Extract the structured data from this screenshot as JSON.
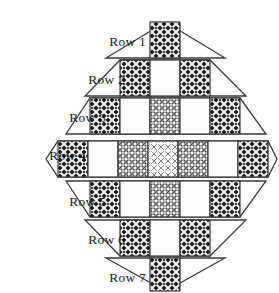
{
  "figure": {
    "background_color": "#ffffff",
    "outline_color": "#3a3a3a"
  },
  "patterns": {
    "dark": {
      "name": "dark-crosshatch",
      "fill": "#303030"
    },
    "medium": {
      "name": "medium-speckle",
      "fill": "#8a8a8a"
    },
    "light": {
      "name": "light-speckle",
      "fill": "#d0d0d0"
    },
    "white": {
      "name": "plain-white",
      "fill": "#ffffff"
    }
  },
  "rows": [
    {
      "label": "Row 1",
      "label_x": 146,
      "label_y": 46,
      "band_top": 22,
      "band_bottom": 58,
      "apex": "top",
      "left_x": 106,
      "right_x": 225,
      "cells": [
        {
          "pattern": "dark",
          "x": 150,
          "w": 30
        }
      ]
    },
    {
      "label": "Row 2",
      "label_x": 125,
      "label_y": 84,
      "band_top": 60,
      "band_bottom": 96,
      "apex": "none",
      "left_x": 85,
      "right_x": 246,
      "cells": [
        {
          "pattern": "dark",
          "x": 120,
          "w": 30
        },
        {
          "pattern": "white",
          "x": 150,
          "w": 30
        },
        {
          "pattern": "dark",
          "x": 180,
          "w": 30
        }
      ]
    },
    {
      "label": "Row 3",
      "label_x": 106,
      "label_y": 122,
      "band_top": 98,
      "band_bottom": 134,
      "apex": "none",
      "left_x": 66,
      "right_x": 266,
      "cells": [
        {
          "pattern": "dark",
          "x": 90,
          "w": 30
        },
        {
          "pattern": "white",
          "x": 120,
          "w": 30
        },
        {
          "pattern": "medium",
          "x": 150,
          "w": 30
        },
        {
          "pattern": "white",
          "x": 180,
          "w": 30
        },
        {
          "pattern": "dark",
          "x": 210,
          "w": 30
        }
      ]
    },
    {
      "label": "Row 4",
      "label_x": 86,
      "label_y": 160,
      "band_top": 141,
      "band_bottom": 177,
      "apex": "both",
      "left_x": 46,
      "right_x": 277,
      "cells": [
        {
          "pattern": "dark",
          "x": 58,
          "w": 30
        },
        {
          "pattern": "white",
          "x": 88,
          "w": 30
        },
        {
          "pattern": "medium",
          "x": 118,
          "w": 30
        },
        {
          "pattern": "light",
          "x": 148,
          "w": 30
        },
        {
          "pattern": "medium",
          "x": 178,
          "w": 30
        },
        {
          "pattern": "white",
          "x": 208,
          "w": 30
        },
        {
          "pattern": "dark",
          "x": 238,
          "w": 30
        }
      ]
    },
    {
      "label": "Row 5",
      "label_x": 106,
      "label_y": 206,
      "band_top": 181,
      "band_bottom": 217,
      "apex": "none",
      "left_x": 66,
      "right_x": 266,
      "cells": [
        {
          "pattern": "dark",
          "x": 90,
          "w": 30
        },
        {
          "pattern": "white",
          "x": 120,
          "w": 30
        },
        {
          "pattern": "medium",
          "x": 150,
          "w": 30
        },
        {
          "pattern": "white",
          "x": 180,
          "w": 30
        },
        {
          "pattern": "dark",
          "x": 210,
          "w": 30
        }
      ]
    },
    {
      "label": "Row 6",
      "label_x": 125,
      "label_y": 244,
      "band_top": 220,
      "band_bottom": 256,
      "apex": "none",
      "left_x": 85,
      "right_x": 246,
      "cells": [
        {
          "pattern": "dark",
          "x": 120,
          "w": 30
        },
        {
          "pattern": "white",
          "x": 150,
          "w": 30
        },
        {
          "pattern": "dark",
          "x": 180,
          "w": 30
        }
      ]
    },
    {
      "label": "Row 7",
      "label_x": 146,
      "label_y": 282,
      "band_top": 258,
      "band_bottom": 291,
      "apex": "bottom",
      "left_x": 106,
      "right_x": 225,
      "cells": [
        {
          "pattern": "dark",
          "x": 150,
          "w": 30
        }
      ]
    }
  ]
}
